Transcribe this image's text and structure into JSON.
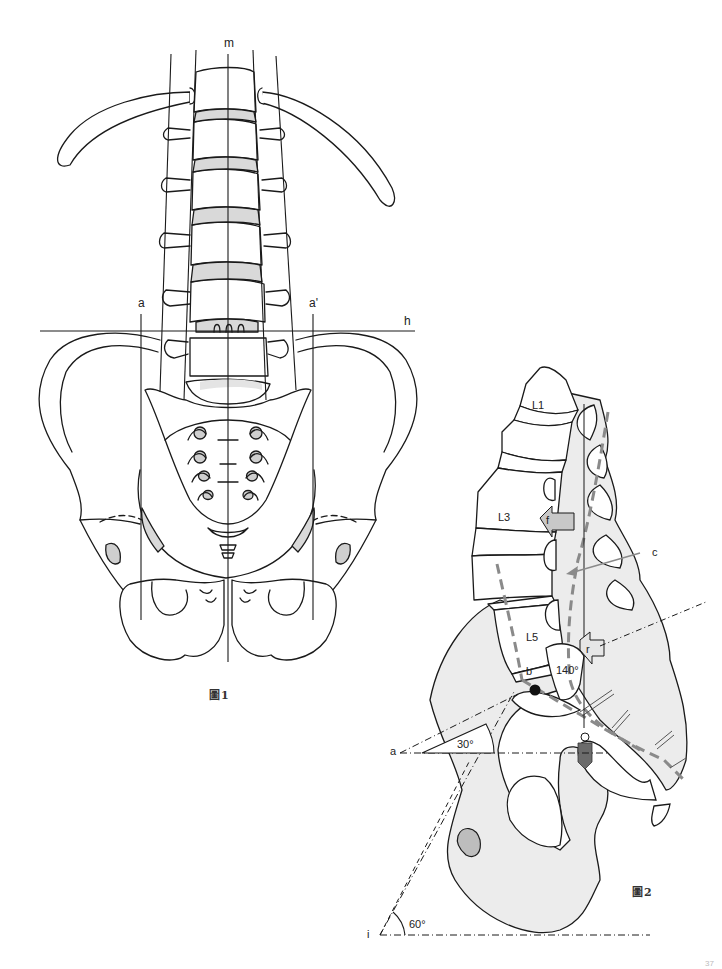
{
  "page": {
    "background": "#ffffff",
    "page_number": "37"
  },
  "figure1": {
    "caption": "圖1",
    "view": "anterior (frontal) view of lumbar spine and pelvis",
    "labels": {
      "m": "m",
      "h": "h",
      "a": "a",
      "a_prime": "a'"
    },
    "colors": {
      "outline": "#1a1a1a",
      "disc_fill": "#d9d9d9",
      "foramen_fill": "#cfcfcf"
    }
  },
  "figure2": {
    "caption": "圖2",
    "view": "lateral (sagittal) view of lumbar spine, sacrum and pelvis",
    "vertebra_labels": {
      "L1": "L1",
      "L3": "L3",
      "L5": "L5"
    },
    "labels": {
      "f": "f",
      "c": "c",
      "r": "r",
      "b": "b",
      "a": "a",
      "i": "i"
    },
    "angles": {
      "lumbosacral": "140°",
      "sacral_tilt": "30°",
      "pelvic_inclination": "60°"
    },
    "colors": {
      "outline": "#1a1a1a",
      "bone_fill": "#ececec",
      "dashed_curve": "#8a8a8a",
      "plumb_bob": "#6b6b6b",
      "arrow_fill": "#c8c8c8"
    }
  }
}
